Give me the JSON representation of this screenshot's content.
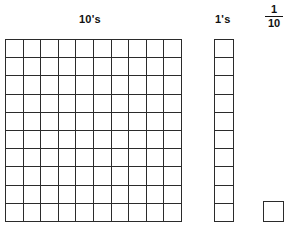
{
  "worksheet": {
    "background_color": "#ffffff",
    "line_color": "#2b2b2b",
    "text_color": "#111111"
  },
  "columns": {
    "tens": {
      "label": "10's",
      "shape": "square-grid",
      "rows": 10,
      "cols": 10,
      "total_cells": 100,
      "filled_cells": 0
    },
    "ones": {
      "label": "1's",
      "shape": "vertical-strip",
      "rows": 10,
      "cols": 1,
      "total_cells": 10,
      "filled_cells": 0
    },
    "tenths": {
      "label_numerator": "1",
      "label_denominator": "10",
      "shape": "single-square",
      "rows": 1,
      "cols": 1,
      "total_cells": 1,
      "filled_cells": 0
    }
  }
}
